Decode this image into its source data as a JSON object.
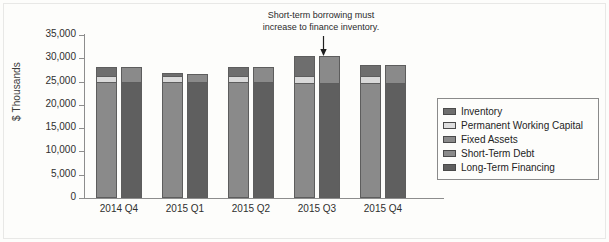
{
  "chart_data": {
    "type": "bar",
    "title": "",
    "subtitle": "",
    "xlabel": "",
    "ylabel": "$ Thousands",
    "ylim": [
      0,
      35000
    ],
    "ytick_labels": [
      "35,000",
      "30,000",
      "25,000",
      "20,000",
      "15,000",
      "10,000",
      "5,000",
      "0"
    ],
    "ytick_values": [
      35000,
      30000,
      25000,
      20000,
      15000,
      10000,
      5000,
      0
    ],
    "grid": false,
    "legend_position": "right",
    "categories": [
      "2014 Q4",
      "2015 Q1",
      "2015 Q2",
      "2015 Q3",
      "2015 Q4"
    ],
    "stacked": true,
    "paired_bars": true,
    "bar_pairs": [
      {
        "name": "Assets",
        "series": [
          "Fixed Assets",
          "Permanent Working Capital",
          "Inventory"
        ]
      },
      {
        "name": "Financing",
        "series": [
          "Long-Term Financing",
          "Short-Term Debt"
        ]
      }
    ],
    "series": [
      {
        "name": "Fixed Assets",
        "bar": "assets",
        "color": "#8a8a8a",
        "values": [
          24900,
          24900,
          24800,
          24700,
          24700
        ]
      },
      {
        "name": "Permanent Working Capital",
        "bar": "assets",
        "color": "#d9d9d9",
        "values": [
          1300,
          1300,
          1300,
          1400,
          1400
        ]
      },
      {
        "name": "Inventory",
        "bar": "assets",
        "color": "#6e6e6e",
        "values": [
          1900,
          600,
          2000,
          4500,
          2400
        ]
      },
      {
        "name": "Long-Term Financing",
        "bar": "financing",
        "color": "#5f5f5f",
        "values": [
          24900,
          24900,
          24800,
          24700,
          24700
        ]
      },
      {
        "name": "Short-Term Debt",
        "bar": "financing",
        "color": "#8a8a8a",
        "values": [
          3200,
          1800,
          3300,
          5900,
          3800
        ]
      }
    ],
    "totals": {
      "assets": [
        28100,
        26800,
        28100,
        30600,
        28500
      ],
      "financing": [
        28100,
        26700,
        28100,
        30600,
        28500
      ]
    },
    "annotations": [
      {
        "text_line1": "Short-term borrowing must",
        "text_line2": "increase to finance inventory.",
        "points_to": "2015 Q3 financing bar"
      }
    ]
  },
  "legend": {
    "items": [
      {
        "label": "Inventory",
        "color": "#6e6e6e"
      },
      {
        "label": "Permanent Working Capital",
        "color": "#dedede"
      },
      {
        "label": "Fixed Assets",
        "color": "#8a8a8a"
      },
      {
        "label": "Short-Term Debt",
        "color": "#8a8a8a"
      },
      {
        "label": "Long-Term Financing",
        "color": "#5f5f5f"
      }
    ]
  },
  "colors": {
    "inventory": "#6e6e6e",
    "permanent_working_capital": "#d9d9d9",
    "fixed_assets": "#8a8a8a",
    "short_term_debt": "#8a8a8a",
    "long_term_financing": "#5f5f5f",
    "axis": "#8d8d8d",
    "text": "#2f2f2f",
    "background": "#fdfdfb"
  }
}
